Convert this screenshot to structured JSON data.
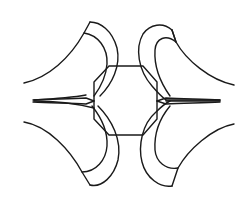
{
  "diagram": {
    "background": "#ffffff",
    "stroke_color": "#1a1a1a",
    "stroke_width": 1.4,
    "elements": {
      "octagon": {
        "label": "central octagon"
      },
      "lobe_upper_left": {
        "label": "upper-left lobe"
      },
      "lobe_upper_right": {
        "label": "upper-right lobe"
      },
      "lobe_lower_left": {
        "label": "lower-left lobe"
      },
      "lobe_lower_right": {
        "label": "lower-right lobe"
      },
      "spike_left": {
        "label": "left horizontal cusp"
      },
      "spike_right": {
        "label": "right horizontal cusp"
      }
    }
  }
}
